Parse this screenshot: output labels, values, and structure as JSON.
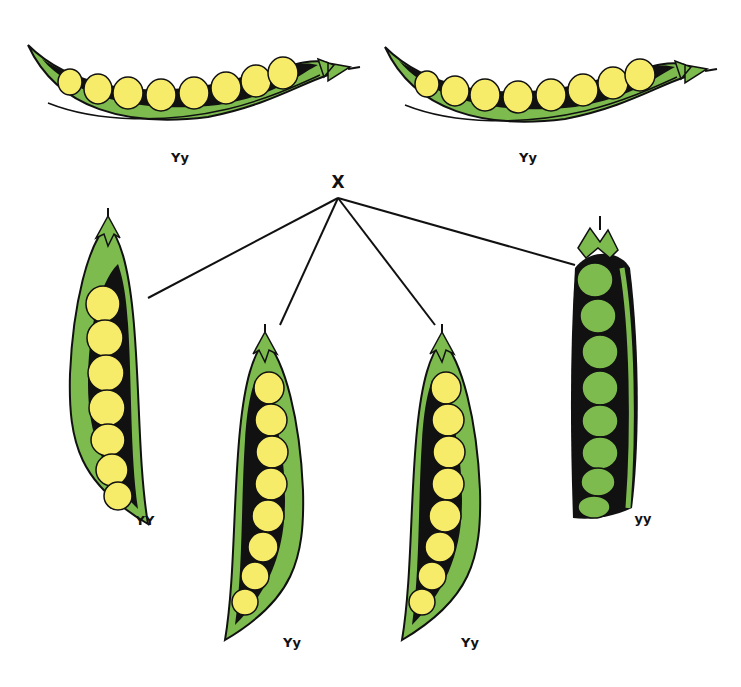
{
  "diagram": {
    "cross_symbol": "X",
    "colors": {
      "pod_green": "#7dbb4f",
      "pod_outline": "#111111",
      "pea_yellow": "#f7ec6a",
      "pea_green": "#7dbb4f",
      "line": "#111111",
      "background": "#ffffff"
    },
    "parents": [
      {
        "id": "parent-left",
        "genotype": "Yy",
        "pea_color": "yellow",
        "pea_count": 8
      },
      {
        "id": "parent-right",
        "genotype": "Yy",
        "pea_color": "yellow",
        "pea_count": 8
      }
    ],
    "offspring": [
      {
        "id": "offspring-1",
        "genotype": "YY",
        "pea_color": "yellow",
        "pea_count": 7
      },
      {
        "id": "offspring-2",
        "genotype": "Yy",
        "pea_color": "yellow",
        "pea_count": 8
      },
      {
        "id": "offspring-3",
        "genotype": "Yy",
        "pea_color": "yellow",
        "pea_count": 8
      },
      {
        "id": "offspring-4",
        "genotype": "yy",
        "pea_color": "green",
        "pea_count": 8
      }
    ]
  }
}
